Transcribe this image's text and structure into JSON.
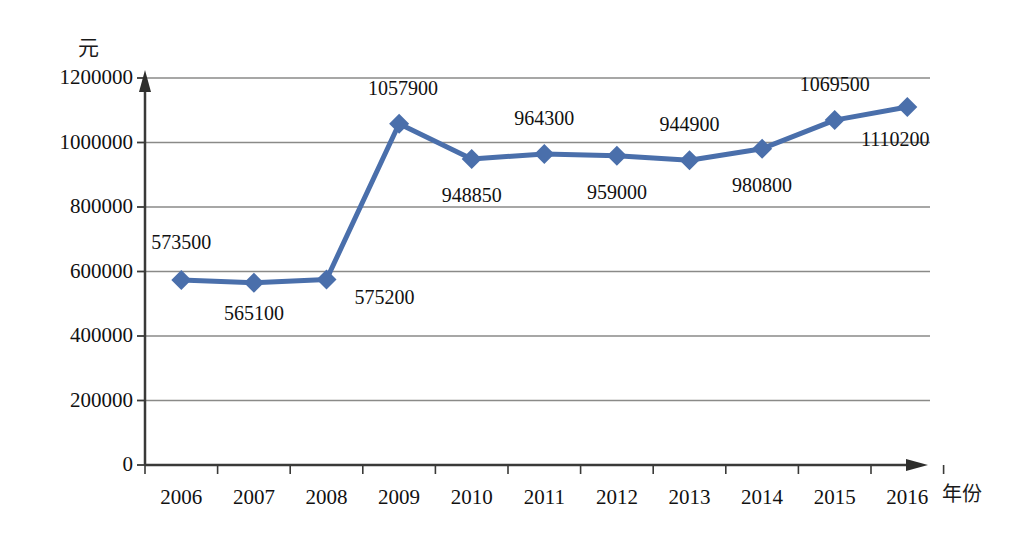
{
  "chart_data": {
    "type": "line",
    "title": "",
    "subtitle": "",
    "xlabel": "年份",
    "ylabel": "元",
    "categories": [
      "2006",
      "2007",
      "2008",
      "2009",
      "2010",
      "2011",
      "2012",
      "2013",
      "2014",
      "2015",
      "2016"
    ],
    "values": [
      573500,
      565100,
      575200,
      1057900,
      948850,
      964300,
      959000,
      944900,
      980800,
      1069500,
      1110200
    ],
    "data_labels": [
      "573500",
      "565100",
      "575200",
      "1057900",
      "948850",
      "964300",
      "959000",
      "944900",
      "980800",
      "1069500",
      "1110200"
    ],
    "ylim": [
      0,
      1200000
    ],
    "y_ticks": [
      0,
      200000,
      400000,
      600000,
      800000,
      1000000,
      1200000
    ],
    "y_tick_labels": [
      "0",
      "200000",
      "400000",
      "600000",
      "800000",
      "1000000",
      "1200000"
    ],
    "grid": true,
    "grid_axis": "y",
    "legend": false,
    "legend_position": "none",
    "series_color": "#4a6fab",
    "marker": "diamond",
    "axis_color": "#3a3a38",
    "grid_color": "#8a8a88"
  },
  "label_offsets": [
    {
      "dx": 0,
      "dy": -38
    },
    {
      "dx": 0,
      "dy": 30
    },
    {
      "dx": 58,
      "dy": 18
    },
    {
      "dx": 4,
      "dy": -36
    },
    {
      "dx": 0,
      "dy": 36
    },
    {
      "dx": 0,
      "dy": -36
    },
    {
      "dx": 0,
      "dy": 36
    },
    {
      "dx": 0,
      "dy": -36
    },
    {
      "dx": 0,
      "dy": 36
    },
    {
      "dx": 0,
      "dy": -36
    },
    {
      "dx": -12,
      "dy": 32
    }
  ]
}
